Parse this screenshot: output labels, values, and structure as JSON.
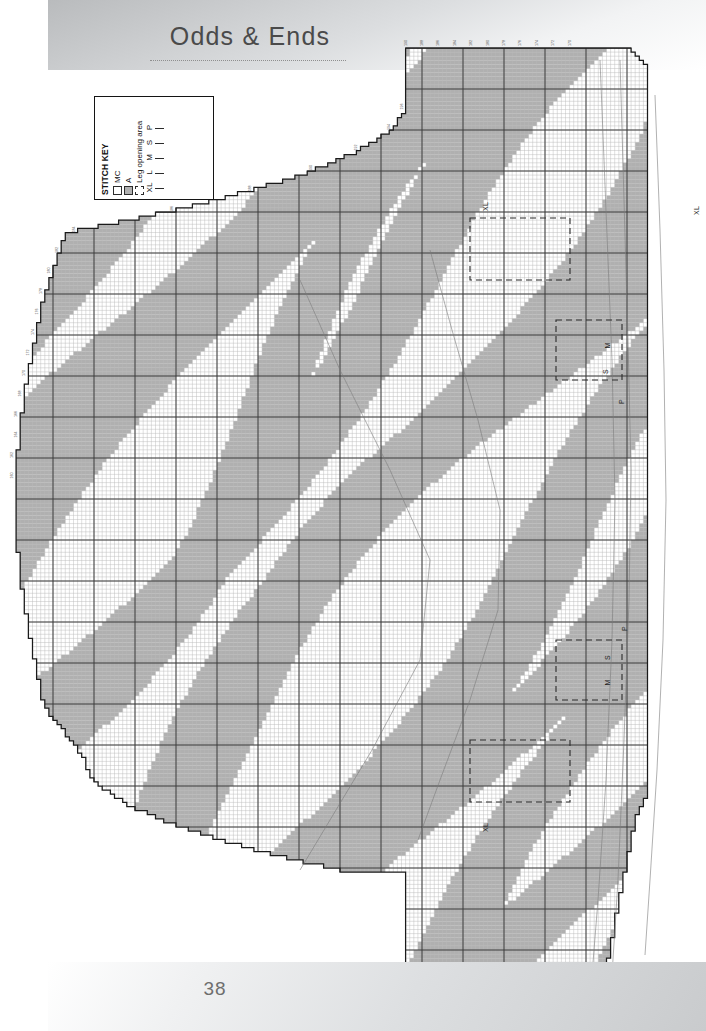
{
  "page": {
    "title": "Odds & Ends",
    "number": "38"
  },
  "stitch_key": {
    "title": "STITCH KEY",
    "swatches": [
      {
        "label": "MC",
        "type": "solid",
        "color": "#ffffff"
      },
      {
        "label": "A",
        "type": "solid",
        "color": "#b0b0b0"
      },
      {
        "label": "Leg opening area",
        "type": "dashed",
        "color": "#ffffff"
      }
    ],
    "sizes": [
      {
        "label": "XL",
        "type": "line"
      },
      {
        "label": "L",
        "type": "line"
      },
      {
        "label": "M",
        "type": "line"
      },
      {
        "label": "S",
        "type": "line"
      },
      {
        "label": "P",
        "type": "line"
      }
    ]
  },
  "chart_annotations": [
    {
      "label": "XL",
      "x": 489,
      "y": 208
    },
    {
      "label": "XL",
      "x": 700,
      "y": 212
    },
    {
      "label": "M",
      "x": 612,
      "y": 347
    },
    {
      "label": "S",
      "x": 611,
      "y": 373
    },
    {
      "label": "P",
      "x": 627,
      "y": 403
    },
    {
      "label": "P",
      "x": 630,
      "y": 630
    },
    {
      "label": "S",
      "x": 613,
      "y": 659
    },
    {
      "label": "M",
      "x": 612,
      "y": 684
    },
    {
      "label": "XL",
      "x": 489,
      "y": 829
    }
  ],
  "chart_data": {
    "type": "heatmap",
    "xlabel": "",
    "ylabel": "",
    "grid": true,
    "cell_px": 4.1,
    "heavy_line_every": 10,
    "colors": {
      "MC": "#ffffff",
      "A": "#b0b0b0",
      "grid": "#b9b9b9",
      "heavy_grid": "#3a3a3a",
      "outline": "#1a1a1a"
    },
    "legend_position": "upper-left",
    "columns": 155,
    "rows": 230,
    "column_tick_labels_top": [
      "190",
      "188",
      "186",
      "184",
      "182",
      "180",
      "178",
      "176",
      "174",
      "172",
      "170"
    ],
    "column_tick_labels_bottom": [
      "20",
      "18",
      "16",
      "14",
      "12",
      "10",
      "8",
      "6",
      "4",
      "2"
    ],
    "row_tick_labels_left": [
      "196",
      "194",
      "192",
      "190",
      "188",
      "186",
      "184",
      "182",
      "180",
      "178",
      "176",
      "174",
      "172",
      "170",
      "168",
      "166",
      "164",
      "162",
      "160"
    ],
    "stripes": [
      {
        "phase": 0.0,
        "width": 0.06,
        "slope": 0.62
      },
      {
        "phase": 0.085,
        "width": 0.055,
        "slope": 0.58
      },
      {
        "phase": 0.17,
        "width": 0.062,
        "slope": 0.7
      },
      {
        "phase": 0.25,
        "width": 0.05,
        "slope": 0.55
      },
      {
        "phase": 0.33,
        "width": 0.058,
        "slope": 0.66
      },
      {
        "phase": 0.415,
        "width": 0.052,
        "slope": 0.6
      },
      {
        "phase": 0.495,
        "width": 0.064,
        "slope": 0.72
      },
      {
        "phase": 0.58,
        "width": 0.05,
        "slope": 0.57
      },
      {
        "phase": 0.66,
        "width": 0.06,
        "slope": 0.68
      },
      {
        "phase": 0.745,
        "width": 0.054,
        "slope": 0.61
      },
      {
        "phase": 0.83,
        "width": 0.058,
        "slope": 0.64
      },
      {
        "phase": 0.915,
        "width": 0.052,
        "slope": 0.59
      }
    ]
  }
}
